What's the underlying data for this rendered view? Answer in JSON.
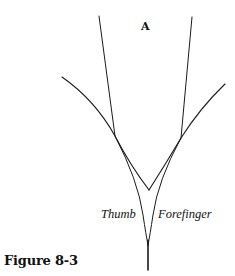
{
  "figure": {
    "caption": "Figure 8-3",
    "panel_label": "A",
    "labels": {
      "left": "Thumb",
      "right": "Forefinger"
    }
  }
}
